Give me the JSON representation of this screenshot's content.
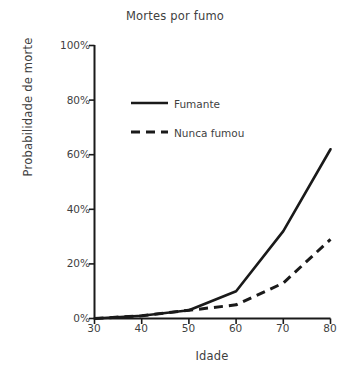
{
  "chart_data": {
    "type": "line",
    "title": "Mortes por fumo",
    "xlabel": "Idade",
    "ylabel": "Probabilidade de morte",
    "x": [
      30,
      40,
      50,
      60,
      70,
      80
    ],
    "xlim": [
      30,
      80
    ],
    "ylim": [
      0,
      100
    ],
    "xticks": [
      30,
      40,
      50,
      60,
      70,
      80
    ],
    "xtick_labels": [
      "30",
      "40",
      "50",
      "60",
      "70",
      "80"
    ],
    "yticks": [
      0,
      20,
      40,
      60,
      80,
      100
    ],
    "ytick_labels": [
      "0%",
      "20%",
      "40%",
      "60%",
      "80%",
      "100%"
    ],
    "grid": false,
    "legend_position": "upper-left-inside",
    "series": [
      {
        "name": "Fumante",
        "style": "solid",
        "color": "#1a1a1a",
        "values": [
          0,
          1,
          3,
          10,
          32,
          62
        ]
      },
      {
        "name": "Nunca fumou",
        "style": "dashed",
        "color": "#1a1a1a",
        "values": [
          0,
          1,
          3,
          5,
          13,
          29
        ]
      }
    ]
  },
  "legend": {
    "items": [
      {
        "label": "Fumante"
      },
      {
        "label": "Nunca fumou"
      }
    ]
  },
  "axes": {
    "y_tick_0": "0%",
    "y_tick_1": "20%",
    "y_tick_2": "40%",
    "y_tick_3": "60%",
    "y_tick_4": "80%",
    "y_tick_5": "100%",
    "x_tick_0": "30",
    "x_tick_1": "40",
    "x_tick_2": "50",
    "x_tick_3": "60",
    "x_tick_4": "70",
    "x_tick_5": "80"
  }
}
